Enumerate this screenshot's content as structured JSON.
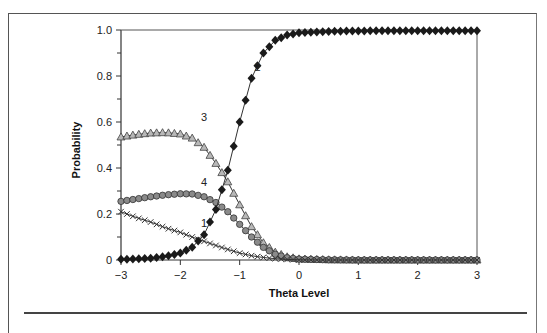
{
  "chart_data": {
    "type": "line",
    "title": "",
    "xlabel": "Theta Level",
    "ylabel": "Probability",
    "xlim": [
      -3,
      3
    ],
    "ylim": [
      0,
      1.0
    ],
    "x_ticks": [
      "−3",
      "−2",
      "−1",
      "0",
      "1",
      "2",
      "3"
    ],
    "x_tick_values": [
      -3,
      -2,
      -1,
      0,
      1,
      2,
      3
    ],
    "y_ticks": [
      "0",
      "0.2",
      "0.4",
      "0.6",
      "0.8",
      "1.0"
    ],
    "y_tick_values": [
      0,
      0.2,
      0.4,
      0.6,
      0.8,
      1.0
    ],
    "grid": false,
    "legend": "inline curve labels",
    "series": [
      {
        "name": "1",
        "marker": "x",
        "label_pos": [
          -1.6,
          0.16
        ],
        "points": [
          [
            -3,
            0.21
          ],
          [
            -2.75,
            0.185
          ],
          [
            -2.5,
            0.165
          ],
          [
            -2.25,
            0.14
          ],
          [
            -2,
            0.12
          ],
          [
            -1.75,
            0.095
          ],
          [
            -1.5,
            0.072
          ],
          [
            -1.25,
            0.05
          ],
          [
            -1,
            0.03
          ],
          [
            -0.75,
            0.016
          ],
          [
            -0.5,
            0.008
          ],
          [
            -0.25,
            0.003
          ],
          [
            0,
            0.001
          ],
          [
            0.5,
            0
          ],
          [
            1,
            0
          ],
          [
            2,
            0
          ],
          [
            3,
            0
          ]
        ]
      },
      {
        "name": "2",
        "marker": "diamond",
        "label_pos": [
          -0.7,
          0.84
        ],
        "points": [
          [
            -3,
            0.003
          ],
          [
            -2.75,
            0.005
          ],
          [
            -2.5,
            0.008
          ],
          [
            -2.25,
            0.015
          ],
          [
            -2,
            0.03
          ],
          [
            -1.8,
            0.055
          ],
          [
            -1.6,
            0.11
          ],
          [
            -1.4,
            0.22
          ],
          [
            -1.2,
            0.39
          ],
          [
            -1,
            0.6
          ],
          [
            -0.8,
            0.79
          ],
          [
            -0.6,
            0.9
          ],
          [
            -0.4,
            0.955
          ],
          [
            -0.2,
            0.978
          ],
          [
            0,
            0.988
          ],
          [
            0.5,
            0.994
          ],
          [
            1,
            0.996
          ],
          [
            2,
            0.997
          ],
          [
            3,
            0.997
          ]
        ]
      },
      {
        "name": "3",
        "marker": "triangle",
        "label_pos": [
          -1.6,
          0.62
        ],
        "points": [
          [
            -3,
            0.535
          ],
          [
            -2.75,
            0.545
          ],
          [
            -2.5,
            0.552
          ],
          [
            -2.25,
            0.554
          ],
          [
            -2,
            0.548
          ],
          [
            -1.8,
            0.53
          ],
          [
            -1.6,
            0.49
          ],
          [
            -1.4,
            0.42
          ],
          [
            -1.2,
            0.34
          ],
          [
            -1,
            0.24
          ],
          [
            -0.8,
            0.145
          ],
          [
            -0.6,
            0.075
          ],
          [
            -0.4,
            0.034
          ],
          [
            -0.2,
            0.014
          ],
          [
            0,
            0.005
          ],
          [
            0.5,
            0.001
          ],
          [
            1,
            0
          ],
          [
            2,
            0
          ],
          [
            3,
            0
          ]
        ]
      },
      {
        "name": "4",
        "marker": "circle",
        "label_pos": [
          -1.6,
          0.34
        ],
        "points": [
          [
            -3,
            0.255
          ],
          [
            -2.75,
            0.265
          ],
          [
            -2.5,
            0.275
          ],
          [
            -2.25,
            0.283
          ],
          [
            -2,
            0.288
          ],
          [
            -1.8,
            0.287
          ],
          [
            -1.6,
            0.275
          ],
          [
            -1.4,
            0.25
          ],
          [
            -1.2,
            0.21
          ],
          [
            -1,
            0.155
          ],
          [
            -0.8,
            0.1
          ],
          [
            -0.6,
            0.055
          ],
          [
            -0.4,
            0.025
          ],
          [
            -0.2,
            0.01
          ],
          [
            0,
            0.004
          ],
          [
            0.5,
            0.001
          ],
          [
            1,
            0
          ],
          [
            2,
            0
          ],
          [
            3,
            0
          ]
        ]
      }
    ]
  }
}
